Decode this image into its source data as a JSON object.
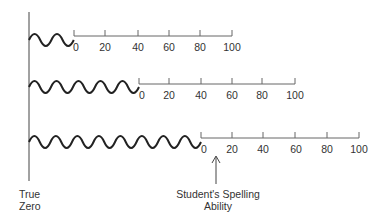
{
  "diagram": {
    "type": "number-line-comparison",
    "vertical_axis_label_line1": "True",
    "vertical_axis_label_line2": "Zero",
    "annotation_line1": "Student's Spelling",
    "annotation_line2": "Ability",
    "tick_labels": [
      "0",
      "20",
      "40",
      "60",
      "80",
      "100"
    ],
    "rows": [
      {
        "name": "scale-1",
        "zero_offset_label": "short offset",
        "ticks": [
          "0",
          "20",
          "40",
          "60",
          "80",
          "100"
        ]
      },
      {
        "name": "scale-2",
        "zero_offset_label": "medium offset",
        "ticks": [
          "0",
          "20",
          "40",
          "60",
          "80",
          "100"
        ]
      },
      {
        "name": "scale-3",
        "zero_offset_label": "long offset",
        "ticks": [
          "0",
          "20",
          "40",
          "60",
          "80",
          "100"
        ]
      }
    ],
    "line_color": "#555555",
    "wave_color": "#222222"
  },
  "labels": {
    "r1": [
      "0",
      "20",
      "40",
      "60",
      "80",
      "100"
    ],
    "r2": [
      "0",
      "20",
      "40",
      "60",
      "80",
      "100"
    ],
    "r3": [
      "0",
      "20",
      "40",
      "60",
      "80",
      "100"
    ]
  }
}
